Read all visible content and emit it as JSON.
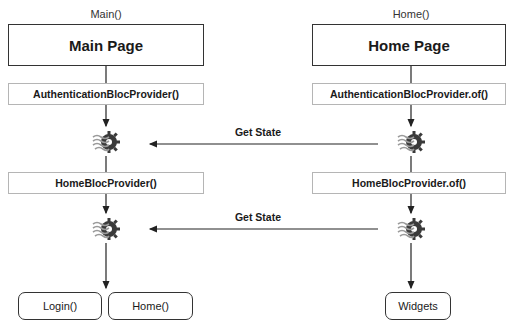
{
  "diagram": {
    "left_column": {
      "label": "Main()",
      "page_title": "Main Page",
      "auth_provider": "AuthenticationBlocProvider()",
      "home_provider": "HomeBlocProvider()",
      "children": [
        "Login()",
        "Home()"
      ]
    },
    "right_column": {
      "label": "Home()",
      "page_title": "Home Page",
      "auth_provider": "AuthenticationBlocProvider.of()",
      "home_provider": "HomeBlocProvider.of()",
      "children": [
        "Widgets"
      ]
    },
    "arrows": [
      {
        "label": "Get State",
        "from": "right-auth-bloc",
        "to": "left-auth-bloc"
      },
      {
        "label": "Get State",
        "from": "right-home-bloc",
        "to": "left-home-bloc"
      }
    ],
    "icons": {
      "bloc": "bloc-gear-icon"
    },
    "colors": {
      "line": "#222222",
      "box_border": "#333333",
      "provider_border": "#b5b5b5",
      "gear": "#3a3a3a",
      "waves": "#9a9a9a"
    }
  }
}
